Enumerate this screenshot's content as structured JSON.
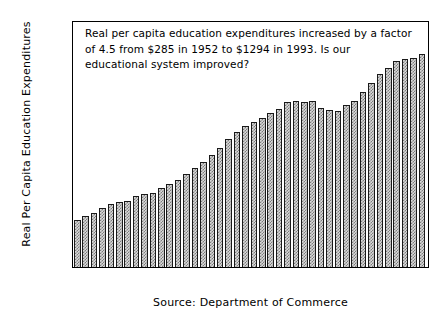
{
  "chart_data": {
    "type": "bar",
    "title": "",
    "xlabel": "",
    "ylabel": "Real Per Capita Education Expenditures",
    "ylim": [
      0,
      1500
    ],
    "yticks": [
      0,
      250,
      500,
      750,
      1000,
      1250,
      1500
    ],
    "xticks": [
      1955,
      1960,
      1965,
      1970,
      1975,
      1980,
      1985,
      1990
    ],
    "grid": false,
    "legend": null,
    "categories": [
      1952,
      1953,
      1954,
      1955,
      1956,
      1957,
      1958,
      1959,
      1960,
      1961,
      1962,
      1963,
      1964,
      1965,
      1966,
      1967,
      1968,
      1969,
      1970,
      1971,
      1972,
      1973,
      1974,
      1975,
      1976,
      1977,
      1978,
      1979,
      1980,
      1981,
      1982,
      1983,
      1984,
      1985,
      1986,
      1987,
      1988,
      1989,
      1990,
      1991,
      1992,
      1993
    ],
    "values": [
      285,
      310,
      330,
      360,
      380,
      395,
      400,
      430,
      445,
      450,
      480,
      505,
      530,
      565,
      600,
      635,
      680,
      720,
      775,
      820,
      855,
      880,
      905,
      935,
      960,
      1000,
      1010,
      1005,
      1010,
      965,
      955,
      950,
      985,
      1010,
      1060,
      1120,
      1170,
      1210,
      1250,
      1265,
      1270,
      1294
    ],
    "annotation": {
      "line1": "Real per capita education expenditures increased by a factor",
      "line2": "of 4.5 from $285 in 1952 to $1294 in 1993. Is our",
      "line3": "educational system improved?"
    },
    "caption": "Source: Department of Commerce",
    "colors": {
      "bar_fill": "#d9d9d9",
      "bar_pattern": "#7d7d7d",
      "bar_edge": "#1a1a1a",
      "axis": "#000000",
      "background": "#ffffff"
    }
  }
}
